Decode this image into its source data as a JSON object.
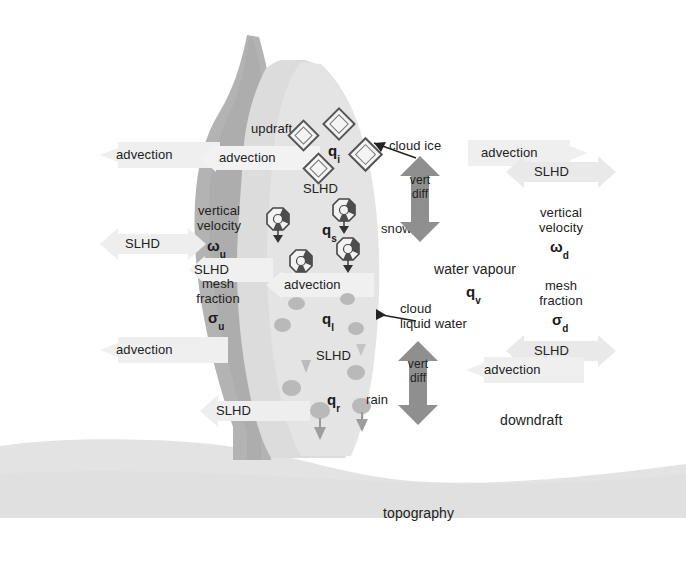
{
  "figure": {
    "colors": {
      "background": "#ffffff",
      "topography": "#e2e2e2",
      "updraft_column": "#b5b5b5",
      "cloud_body": "#dcdcdc",
      "cloud_body_light": "#e6e6e6",
      "pale_arrow": "#eeeeee",
      "dark_arrow": "#8e8e8e",
      "particle_outline": "#555555",
      "droplet": "#b9b9b9",
      "text": "#222222"
    }
  },
  "labels": {
    "topography": "topography",
    "updraft": "updraft",
    "downdraft": "downdraft",
    "cloud_ice": "cloud ice",
    "snow": "snow",
    "rain": "rain",
    "cloud_liquid_water_line1": "cloud",
    "cloud_liquid_water_line2": "liquid water",
    "water_vapour": "water vapour",
    "advection": "advection",
    "slhd": "SLHD",
    "vert": "vert",
    "diff": "diff",
    "vertical": "vertical",
    "velocity": "velocity",
    "mesh": "mesh",
    "fraction": "fraction"
  },
  "variables": {
    "q_i": {
      "base": "q",
      "sub": "i",
      "meaning": "cloud ice"
    },
    "q_s": {
      "base": "q",
      "sub": "s",
      "meaning": "snow"
    },
    "q_l": {
      "base": "q",
      "sub": "l",
      "meaning": "cloud liquid water"
    },
    "q_r": {
      "base": "q",
      "sub": "r",
      "meaning": "rain"
    },
    "q_v": {
      "base": "q",
      "sub": "v",
      "meaning": "water vapour"
    },
    "omega_u": {
      "base": "ω",
      "sub": "u",
      "meaning": "updraft vertical velocity"
    },
    "omega_d": {
      "base": "ω",
      "sub": "d",
      "meaning": "downdraft vertical velocity"
    },
    "sigma_u": {
      "base": "σ",
      "sub": "u",
      "meaning": "updraft mesh fraction"
    },
    "sigma_d": {
      "base": "σ",
      "sub": "d",
      "meaning": "downdraft mesh fraction"
    }
  },
  "left_column": {
    "advection_outer_top": "advection",
    "slhd_outer_mid": "SLHD",
    "advection_inner_top": "advection",
    "vertical": "vertical",
    "velocity": "velocity",
    "slhd_inner_mid": "SLHD",
    "mesh": "mesh",
    "fraction": "fraction",
    "advection_inner_low": "advection",
    "slhd_low": "SLHD"
  },
  "cloud_column": {
    "slhd_ice": "SLHD",
    "advection_snow": "advection",
    "slhd_liquid": "SLHD"
  },
  "right_column": {
    "advection_top": "advection",
    "slhd_top": "SLHD",
    "vertical": "vertical",
    "velocity": "velocity",
    "mesh": "mesh",
    "fraction": "fraction",
    "slhd_low": "SLHD",
    "advection_low": "advection",
    "downdraft": "downdraft"
  },
  "vert_diff": {
    "upper": {
      "line1": "vert",
      "line2": "diff"
    },
    "lower": {
      "line1": "vert",
      "line2": "diff"
    }
  }
}
